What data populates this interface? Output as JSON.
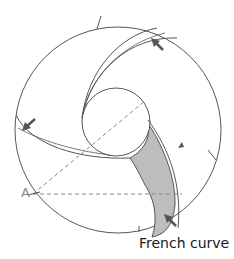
{
  "diagram": {
    "labels": {
      "point_a": "A",
      "french_curve": "French curve"
    },
    "colors": {
      "line": "#555555",
      "dashed": "#888888",
      "fill": "#bdbdbd",
      "arrow": "#555555"
    }
  }
}
